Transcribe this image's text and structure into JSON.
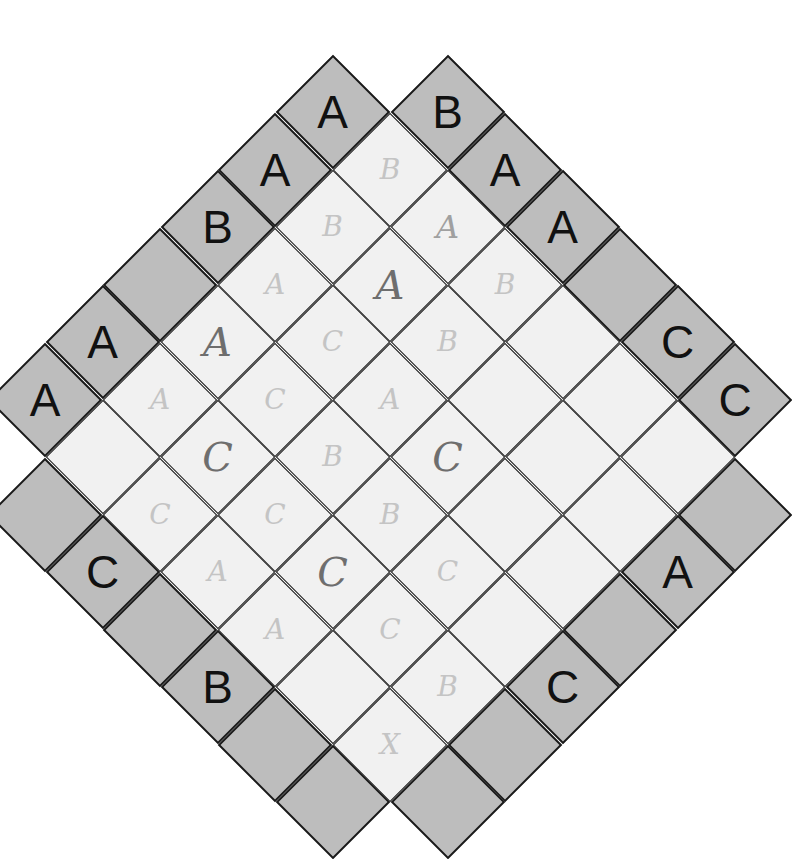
{
  "puzzle": {
    "type": "Easy as ABC (diagonal)",
    "letters": [
      "A",
      "B",
      "C"
    ],
    "size": 6,
    "clues": {
      "top_left": [
        "A",
        "A",
        "B",
        "",
        "A",
        "A"
      ],
      "top_right": [
        "B",
        "A",
        "A",
        "",
        "C",
        "C"
      ],
      "bottom_left": [
        "",
        "C",
        "",
        "B",
        "",
        ""
      ],
      "bottom_right": [
        "",
        "A",
        "",
        "C",
        "",
        ""
      ]
    },
    "pencil_marks": [
      {
        "r": 0,
        "c": 0,
        "text": "B",
        "weight": "faint"
      },
      {
        "r": 0,
        "c": 1,
        "text": "A",
        "weight": "mid"
      },
      {
        "r": 0,
        "c": 2,
        "text": "B",
        "weight": "faint"
      },
      {
        "r": 1,
        "c": 0,
        "text": "B",
        "weight": "faint"
      },
      {
        "r": 1,
        "c": 1,
        "text": "A",
        "weight": "dark"
      },
      {
        "r": 1,
        "c": 2,
        "text": "B",
        "weight": "faint"
      },
      {
        "r": 2,
        "c": 0,
        "text": "A",
        "weight": "faint"
      },
      {
        "r": 2,
        "c": 1,
        "text": "C",
        "weight": "faint"
      },
      {
        "r": 2,
        "c": 2,
        "text": "A",
        "weight": "faint"
      },
      {
        "r": 2,
        "c": 3,
        "text": "C",
        "weight": "dark"
      },
      {
        "r": 3,
        "c": 0,
        "text": "A",
        "weight": "dark"
      },
      {
        "r": 3,
        "c": 1,
        "text": "C",
        "weight": "faint"
      },
      {
        "r": 3,
        "c": 2,
        "text": "B",
        "weight": "faint"
      },
      {
        "r": 3,
        "c": 3,
        "text": "B",
        "weight": "faint"
      },
      {
        "r": 3,
        "c": 4,
        "text": "C",
        "weight": "faint"
      },
      {
        "r": 4,
        "c": 0,
        "text": "A",
        "weight": "faint"
      },
      {
        "r": 4,
        "c": 1,
        "text": "C",
        "weight": "dark"
      },
      {
        "r": 4,
        "c": 2,
        "text": "C",
        "weight": "faint"
      },
      {
        "r": 4,
        "c": 3,
        "text": "C",
        "weight": "dark"
      },
      {
        "r": 5,
        "c": 1,
        "text": "C",
        "weight": "faint"
      },
      {
        "r": 5,
        "c": 2,
        "text": "A",
        "weight": "faint"
      },
      {
        "r": 5,
        "c": 3,
        "text": "A",
        "weight": "faint"
      },
      {
        "r": 4,
        "c": 4,
        "text": "C",
        "weight": "faint"
      },
      {
        "r": 4,
        "c": 5,
        "text": "B",
        "weight": "faint"
      },
      {
        "r": 5,
        "c": 5,
        "text": "X",
        "weight": "faint"
      }
    ]
  },
  "colors": {
    "clue_cell": "#bdbdbd",
    "interior_cell": "#f1f1f1",
    "grid_line": "#1a1a1a",
    "pencil": "#8a8a8a"
  }
}
